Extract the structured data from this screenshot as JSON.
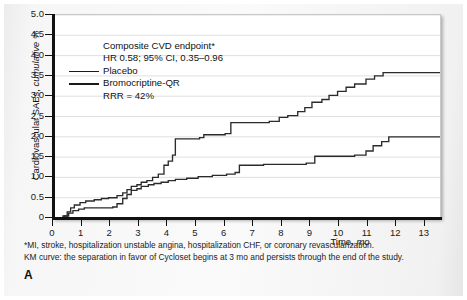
{
  "figure": {
    "panel_letter": "A",
    "footnotes": [
      "*MI, stroke, hospitalization unstable angina, hospitalization CHF, or coronary revascularization.",
      "KM curve: the separation in favor of Cycloset begins at 3 mo and persists through the end of the study."
    ]
  },
  "annotation": {
    "title": "Composite CVD endpoint*",
    "stat": "HR 0.58; 95% CI, 0.35–0.96",
    "legend": [
      {
        "label": "Placebo"
      },
      {
        "label": "Bromocriptine-QR"
      }
    ],
    "rrr": "RRR = 42%"
  },
  "chart_data": {
    "type": "line",
    "title": "Composite CVD endpoint*",
    "subtitle": "HR 0.58; 95% CI, 0.35–0.96",
    "annotations": [
      "RRR = 42%"
    ],
    "xlabel": "Time, mo",
    "ylabel": "Cardiovascular SAEs, cumulative %",
    "xlim": [
      0,
      13.6
    ],
    "ylim": [
      0,
      5.0
    ],
    "xticks": [
      0,
      1,
      2,
      3,
      4,
      5,
      6,
      7,
      8,
      9,
      10,
      11,
      12,
      13
    ],
    "xticklabels": [
      "0",
      "1",
      "2",
      "3",
      "4",
      "5",
      "6",
      "7",
      "8",
      "9",
      "10",
      "11",
      "12",
      "13"
    ],
    "yticks": [
      0,
      0.5,
      1.0,
      1.5,
      2.0,
      2.5,
      3.0,
      3.5,
      4.0,
      4.5,
      5.0
    ],
    "yticklabels": [
      "0",
      "0.5",
      "1.0",
      "1.5",
      "2.0",
      "2.5",
      "3.0",
      "3.5",
      "4.0",
      "4.5",
      "5.0"
    ],
    "grid": "horizontal",
    "legend_position": "upper-left-inside",
    "line_color": "#2b2b2b",
    "series": [
      {
        "name": "Placebo",
        "step": "post",
        "x": [
          0.0,
          0.35,
          0.5,
          0.62,
          0.75,
          0.95,
          1.15,
          1.45,
          1.7,
          1.95,
          2.25,
          2.45,
          2.6,
          2.75,
          2.95,
          3.1,
          3.3,
          3.5,
          3.7,
          3.9,
          4.05,
          4.2,
          4.3,
          5.15,
          5.3,
          6.05,
          6.25,
          7.6,
          7.95,
          8.25,
          8.6,
          8.85,
          9.1,
          9.45,
          9.7,
          10.0,
          10.3,
          10.6,
          11.0,
          11.3,
          11.6,
          13.6
        ],
        "y": [
          0.0,
          0.05,
          0.15,
          0.25,
          0.32,
          0.38,
          0.42,
          0.45,
          0.48,
          0.5,
          0.55,
          0.62,
          0.7,
          0.78,
          0.82,
          0.88,
          0.92,
          1.0,
          1.08,
          1.3,
          1.4,
          1.55,
          1.95,
          1.98,
          2.05,
          2.08,
          2.35,
          2.38,
          2.48,
          2.52,
          2.62,
          2.72,
          2.85,
          2.92,
          3.02,
          3.12,
          3.22,
          3.3,
          3.42,
          3.5,
          3.58,
          3.58
        ]
      },
      {
        "name": "Bromocriptine-QR",
        "step": "post",
        "x": [
          0.0,
          0.4,
          0.55,
          0.7,
          0.9,
          1.1,
          2.1,
          2.25,
          2.45,
          2.6,
          2.75,
          2.95,
          3.1,
          3.35,
          3.55,
          3.8,
          4.05,
          4.3,
          4.7,
          5.1,
          5.6,
          6.1,
          6.4,
          6.55,
          7.4,
          8.9,
          9.2,
          10.6,
          11.0,
          11.25,
          11.55,
          11.8,
          13.6
        ],
        "y": [
          0.0,
          0.05,
          0.12,
          0.18,
          0.22,
          0.25,
          0.27,
          0.35,
          0.48,
          0.58,
          0.68,
          0.72,
          0.78,
          0.82,
          0.85,
          0.88,
          0.92,
          0.95,
          0.98,
          1.02,
          1.05,
          1.08,
          1.12,
          1.3,
          1.32,
          1.35,
          1.52,
          1.55,
          1.65,
          1.78,
          1.88,
          2.0,
          2.0
        ]
      }
    ]
  }
}
